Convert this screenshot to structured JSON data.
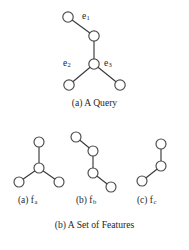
{
  "figure": {
    "background_color": "#ffffff",
    "stroke_color": "#3a3a3a",
    "node_fill_color": "#ffffff",
    "node_radius": 5.0,
    "panels": [
      {
        "id": "query",
        "caption": "(a) A Query",
        "caption_x": 94,
        "caption_y": 101,
        "nodes": [
          {
            "id": "q0",
            "cx": 68,
            "cy": 17
          },
          {
            "id": "q1",
            "cx": 94,
            "cy": 36
          },
          {
            "id": "q2",
            "cx": 94,
            "cy": 64
          },
          {
            "id": "q3",
            "cx": 69,
            "cy": 85
          },
          {
            "id": "q4",
            "cx": 120,
            "cy": 85
          }
        ],
        "edges": [
          {
            "id": "e1",
            "from": "q0",
            "to": "q1",
            "label": "e",
            "subscript": "1",
            "label_x": 82,
            "label_y": 13
          },
          {
            "id": "e-spine",
            "from": "q1",
            "to": "q2",
            "label": null,
            "subscript": null
          },
          {
            "id": "e2",
            "from": "q2",
            "to": "q3",
            "label": "e",
            "subscript": "2",
            "label_x": 64,
            "label_y": 60
          },
          {
            "id": "e3",
            "from": "q2",
            "to": "q4",
            "label": "e",
            "subscript": "3",
            "label_x": 105,
            "label_y": 60
          }
        ]
      },
      {
        "id": "feature_a",
        "caption": "(a) f",
        "caption_subscript": "a",
        "caption_x": 21,
        "caption_y": 199,
        "nodes": [
          {
            "id": "a0",
            "cx": 39,
            "cy": 142
          },
          {
            "id": "a1",
            "cx": 39,
            "cy": 168
          },
          {
            "id": "a2",
            "cx": 19,
            "cy": 182
          },
          {
            "id": "a3",
            "cx": 59,
            "cy": 182
          }
        ],
        "edges": [
          {
            "from": "a0",
            "to": "a1"
          },
          {
            "from": "a1",
            "to": "a2"
          },
          {
            "from": "a1",
            "to": "a3"
          }
        ]
      },
      {
        "id": "feature_b",
        "caption": "(b) f",
        "caption_subscript": "b",
        "caption_x": 79,
        "caption_y": 199,
        "nodes": [
          {
            "id": "b0",
            "cx": 76,
            "cy": 137
          },
          {
            "id": "b1",
            "cx": 93,
            "cy": 151
          },
          {
            "id": "b2",
            "cx": 93,
            "cy": 173
          },
          {
            "id": "b3",
            "cx": 111,
            "cy": 187
          }
        ],
        "edges": [
          {
            "from": "b0",
            "to": "b1"
          },
          {
            "from": "b1",
            "to": "b2"
          },
          {
            "from": "b2",
            "to": "b3"
          }
        ]
      },
      {
        "id": "feature_c",
        "caption": "(c) f",
        "caption_subscript": "c",
        "caption_x": 140,
        "caption_y": 199,
        "nodes": [
          {
            "id": "c0",
            "cx": 161,
            "cy": 144
          },
          {
            "id": "c1",
            "cx": 161,
            "cy": 166
          },
          {
            "id": "c2",
            "cx": 142,
            "cy": 181
          }
        ],
        "edges": [
          {
            "from": "c0",
            "to": "c1"
          },
          {
            "from": "c1",
            "to": "c2"
          }
        ]
      }
    ],
    "bottom_caption": "(b) A Set of Features",
    "bottom_caption_x": 94,
    "bottom_caption_y": 224
  }
}
